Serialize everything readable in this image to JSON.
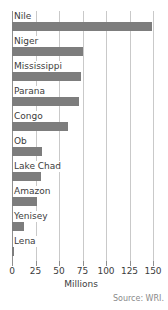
{
  "chart_data": {
    "type": "bar",
    "orientation": "horizontal",
    "title": "Longest Rivers",
    "categories": [
      "Nile",
      "Niger",
      "Mississippi",
      "Parana",
      "Congo",
      "Ob",
      "Lake Chad",
      "Amazon",
      "Yenisey",
      "Lena"
    ],
    "values": [
      149,
      75,
      73,
      71,
      60,
      32,
      31,
      27,
      13,
      2
    ],
    "xlabel": "Millions",
    "ylabel": "",
    "xlim": [
      0,
      150
    ],
    "xticks": [
      0,
      25,
      50,
      75,
      100,
      125,
      150
    ],
    "xticklabels": [
      "0",
      "25",
      "50",
      "75",
      "100",
      "125",
      "150"
    ],
    "grid": true,
    "legend": false,
    "annotations": [
      "Source: WRI."
    ],
    "bar_color": "#7d7d7d",
    "grid_color": "#c9c9c9",
    "axis_color": "#8f8f8f"
  },
  "footer": {
    "source": "Source: WRI."
  }
}
